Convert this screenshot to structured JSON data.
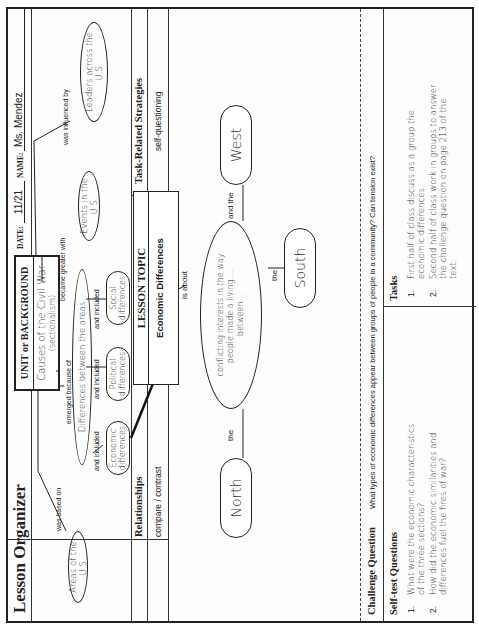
{
  "header": {
    "title": "Lesson Organizer",
    "unit_label": "UNIT or BACKGROUND",
    "unit_value": "Causes of the Civil War",
    "unit_sub": "(sectionalism)",
    "date_label": "DATE:",
    "date_value": "11/21",
    "name_label": "NAME:",
    "name_value": "Ms. Mendez"
  },
  "concept_map": {
    "areas": "Areas of the U.S.",
    "was_based_on": "was based on",
    "emerged_because_of": "emerged because of",
    "differences": "Differences between the areas",
    "and_included_1": "and included",
    "and_included_2": "and included",
    "and_included_3": "and included",
    "economic": "Economic differences",
    "political": "Political differences",
    "social": "Social differences",
    "became_greater_with": "became greater with",
    "events": "Events in the U.S.",
    "was_influenced_by": "was influenced by",
    "leaders": "Leaders across the U.S."
  },
  "columns": {
    "relationships_label": "Relationships",
    "relationships_value": "compare / contrast",
    "lesson_topic_label": "LESSON TOPIC",
    "lesson_topic_value": "Economic Differences",
    "strategies_label": "Task-Related Strategies",
    "strategies_value": "self-questioning"
  },
  "main_map": {
    "is_about": "is about",
    "center": "conflicting interests in the way people made a living..... between...",
    "left_link": "the",
    "middle_link": "the",
    "right_link": "and the",
    "north": "North",
    "south": "South",
    "west": "West"
  },
  "challenge": {
    "label": "Challenge Question",
    "text": "What types of economic differences appear between groups of people in a community? Can tension exist?"
  },
  "self_test": {
    "label": "Self-test Questions",
    "items": [
      {
        "num": "1.",
        "text": "What were the economic characteristics of the three sections?"
      },
      {
        "num": "2.",
        "text": "How did the economic similarities and differences fuel the fires of war?"
      }
    ]
  },
  "tasks": {
    "label": "Tasks",
    "items": [
      {
        "num": "1.",
        "text": "First half of class discuss as a group the economic differences."
      },
      {
        "num": "2.",
        "text": "Second half of class work in groups to answer the challenge question on page 213 of the text."
      }
    ]
  }
}
